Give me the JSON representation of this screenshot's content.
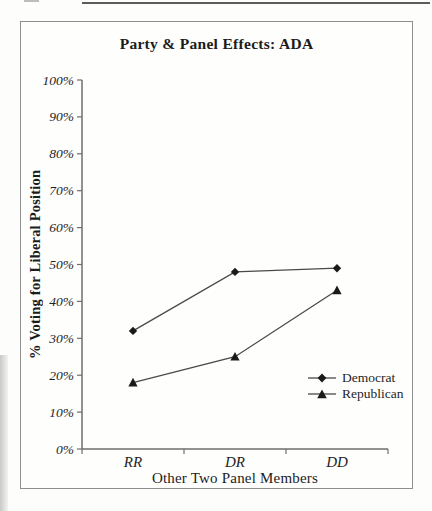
{
  "chart_data": {
    "type": "line",
    "title": "Party & Panel Effects: ADA",
    "categories": [
      "RR",
      "DR",
      "DD"
    ],
    "series": [
      {
        "name": "Democrat",
        "marker": "diamond",
        "values": [
          32,
          48,
          49
        ]
      },
      {
        "name": "Republican",
        "marker": "triangle",
        "values": [
          18,
          25,
          43
        ]
      }
    ],
    "xlabel": "Other Two Panel Members",
    "ylabel": "% Voting for Liberal Position",
    "ylim": [
      0,
      100
    ],
    "ytick_step": 10,
    "ytick_labels": [
      "0%",
      "10%",
      "20%",
      "30%",
      "40%",
      "50%",
      "60%",
      "70%",
      "80%",
      "90%",
      "100%"
    ],
    "grid": false,
    "legend_position": "inside-bottom-right",
    "colors": {
      "marker": "#1a1a1a",
      "line": "#4a4a4a",
      "axis": "#6e6e6e",
      "frame": "#8f8f8f",
      "text": "#1f1f1f",
      "page_rule": "#5c5c5c"
    }
  }
}
